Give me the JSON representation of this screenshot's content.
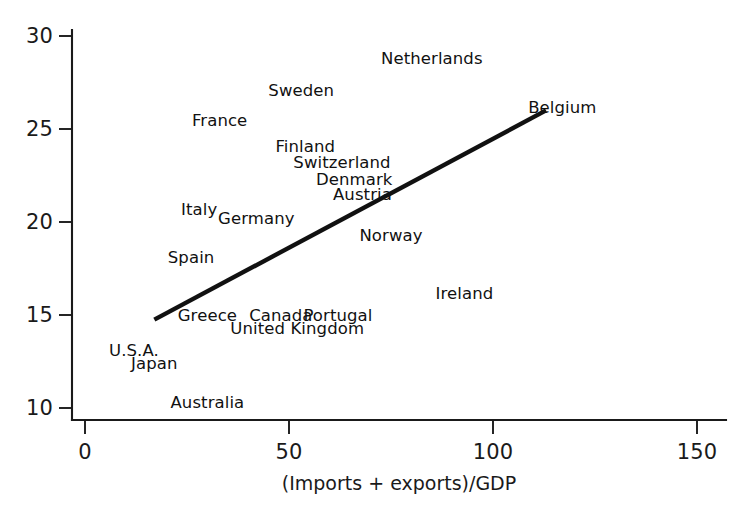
{
  "chart_data": {
    "type": "scatter",
    "title": "",
    "subtitle": "",
    "xlabel": "(Imports + exports)/GDP",
    "ylabel": "",
    "xlim": [
      -20,
      160
    ],
    "ylim": [
      8.7,
      31.4
    ],
    "grid": false,
    "legend": null,
    "x_ticks": [
      0,
      50,
      100,
      150
    ],
    "y_ticks": [
      10,
      15,
      20,
      25,
      30
    ],
    "x_tick_labels": [
      "0",
      "50",
      "100",
      "150"
    ],
    "y_tick_labels": [
      "10",
      "15",
      "20",
      "25",
      "30"
    ],
    "point_label_mode": "text-only-no-markers",
    "points": [
      {
        "label": "Netherlands",
        "x": 85,
        "y": 28.8
      },
      {
        "label": "Sweden",
        "x": 53,
        "y": 27.1
      },
      {
        "label": "Belgium",
        "x": 117,
        "y": 26.2
      },
      {
        "label": "France",
        "x": 33,
        "y": 25.5
      },
      {
        "label": "Finland",
        "x": 54,
        "y": 24.1
      },
      {
        "label": "Switzerland",
        "x": 63,
        "y": 23.2
      },
      {
        "label": "Denmark",
        "x": 66,
        "y": 22.3
      },
      {
        "label": "Austria",
        "x": 68,
        "y": 21.5
      },
      {
        "label": "Italy",
        "x": 28,
        "y": 20.7
      },
      {
        "label": "Germany",
        "x": 42,
        "y": 20.2
      },
      {
        "label": "Norway",
        "x": 75,
        "y": 19.3
      },
      {
        "label": "Spain",
        "x": 26,
        "y": 18.1
      },
      {
        "label": "Ireland",
        "x": 93,
        "y": 16.2
      },
      {
        "label": "Greece",
        "x": 30,
        "y": 15.0
      },
      {
        "label": "Canada",
        "x": 48,
        "y": 15.0
      },
      {
        "label": "Portugal",
        "x": 62,
        "y": 15.0
      },
      {
        "label": "United Kingdom",
        "x": 52,
        "y": 14.3
      },
      {
        "label": "U.S.A.",
        "x": 12,
        "y": 13.1
      },
      {
        "label": "Japan",
        "x": 17,
        "y": 12.4
      },
      {
        "label": "Australia",
        "x": 30,
        "y": 10.3
      }
    ],
    "trend_line": {
      "x_start": 17,
      "y_start": 14.75,
      "x_end": 113,
      "y_end": 26.0
    },
    "annotations": []
  },
  "axes": {
    "x_axis_name": "x-axis",
    "y_axis_name": "y-axis"
  },
  "colors": {
    "foreground": "#1a1a1a",
    "line": "#111111",
    "background": "#ffffff"
  }
}
